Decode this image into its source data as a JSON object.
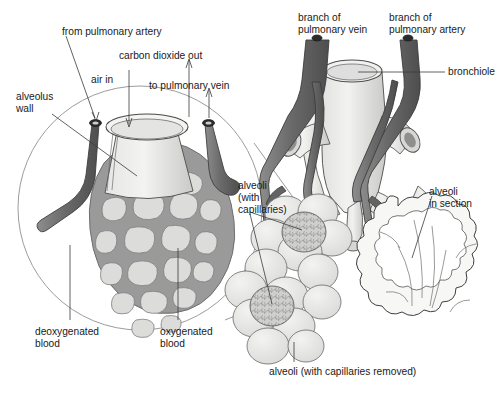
{
  "diagram": {
    "background": "#ffffff",
    "palette": {
      "vessel_dark": "#6e6e6e",
      "vessel_shadow": "#4f4f4f",
      "capillary_mesh": "#939393",
      "capillary_fill": "#d7d7d7",
      "tissue_light": "#ededeb",
      "tissue_mid": "#dcdcda",
      "alveoli_fill": "#e9e9e7",
      "outline": "#3a3a3a",
      "text": "#1a1a1a"
    }
  },
  "labels": {
    "from_pulmonary_artery": "from pulmonary artery",
    "carbon_dioxide_out": "carbon dioxide out",
    "air_in": "air in",
    "to_pulmonary_vein": "to pulmonary vein",
    "alveolus_wall": "alveolus\nwall",
    "deoxygenated_blood": "deoxygenated\nblood",
    "oxygenated_blood": "oxygenated\nblood",
    "branch_of_pulmonary_vein": "branch of\npulmonary vein",
    "branch_of_pulmonary_artery": "branch of\npulmonary artery",
    "bronchiole": "bronchiole",
    "alveoli_with_capillaries": "alveoli\n(with\ncapillaries)",
    "alveoli_in_section": "alveoli\nin section",
    "alveoli_capillaries_removed": "alveoli (with capillaries removed)"
  },
  "arrows": {
    "air_in_direction": "down",
    "carbon_dioxide_out_direction": "up",
    "to_pulmonary_vein_direction": "up",
    "from_pulmonary_artery_direction": "down"
  }
}
